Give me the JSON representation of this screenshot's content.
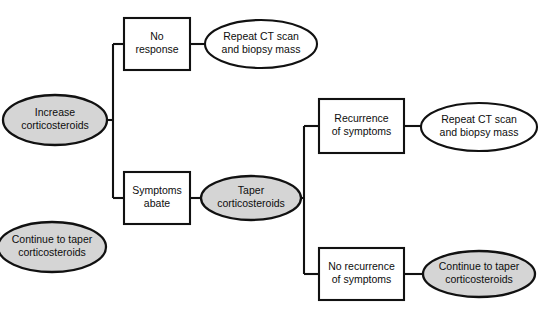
{
  "diagram": {
    "colors": {
      "filled_node_fill": "#d5d5d5",
      "plain_node_fill": "#ffffff",
      "stroke": "#111111",
      "background": "#ffffff",
      "text": "#0d0d0d"
    },
    "nodes": [
      {
        "id": "increase-corticosteroids",
        "shape": "ellipse",
        "fill": "filled",
        "lines": [
          "Increase",
          "corticosteroids"
        ],
        "cx": 55,
        "cy": 120,
        "rx": 52,
        "ry": 25
      },
      {
        "id": "no-response",
        "shape": "rect",
        "fill": "plain",
        "lines": [
          "No",
          "response"
        ],
        "x": 124,
        "y": 18,
        "w": 66,
        "h": 52
      },
      {
        "id": "repeat-ct-scan-biopsy-top",
        "shape": "ellipse",
        "fill": "plain",
        "lines": [
          "Repeat CT scan",
          "and biopsy mass"
        ],
        "cx": 261,
        "cy": 44,
        "rx": 56,
        "ry": 24
      },
      {
        "id": "symptoms-abate",
        "shape": "rect",
        "fill": "plain",
        "lines": [
          "Symptoms",
          "abate"
        ],
        "x": 124,
        "y": 172,
        "w": 66,
        "h": 52
      },
      {
        "id": "taper-corticosteroids",
        "shape": "ellipse",
        "fill": "filled",
        "lines": [
          "Taper",
          "corticosteroids"
        ],
        "cx": 251,
        "cy": 198,
        "rx": 50,
        "ry": 22
      },
      {
        "id": "recurrence-of-symptoms",
        "shape": "rect",
        "fill": "plain",
        "lines": [
          "Recurrence",
          "of symptoms"
        ],
        "x": 319,
        "y": 99,
        "w": 85,
        "h": 54
      },
      {
        "id": "repeat-ct-scan-biopsy-middle",
        "shape": "ellipse",
        "fill": "plain",
        "lines": [
          "Repeat CT scan",
          "and biopsy mass"
        ],
        "cx": 479,
        "cy": 127,
        "rx": 58,
        "ry": 24
      },
      {
        "id": "no-recurrence-of-symptoms",
        "shape": "rect",
        "fill": "plain",
        "lines": [
          "No recurrence",
          "of symptoms"
        ],
        "x": 319,
        "y": 248,
        "w": 85,
        "h": 52
      },
      {
        "id": "continue-to-taper-right",
        "shape": "ellipse",
        "fill": "filled",
        "lines": [
          "Continue to taper",
          "corticosteroids"
        ],
        "cx": 479,
        "cy": 274,
        "rx": 56,
        "ry": 23
      },
      {
        "id": "continue-to-taper-left",
        "shape": "ellipse",
        "fill": "filled",
        "lines": [
          "Continue to taper",
          "corticosteroids"
        ],
        "cx": 52,
        "cy": 247,
        "rx": 54,
        "ry": 25
      }
    ],
    "connectors": [
      {
        "id": "increase-to-trunk",
        "path": "M 107 120 L 113 120"
      },
      {
        "id": "left-trunk-vertical",
        "path": "M 113 44 L 113 198"
      },
      {
        "id": "trunk-to-no-response",
        "path": "M 113 44 L 124 44"
      },
      {
        "id": "trunk-to-symptoms-abate",
        "path": "M 113 198 L 124 198"
      },
      {
        "id": "no-response-to-repeat-ct-top",
        "path": "M 190 44 L 205 44"
      },
      {
        "id": "symptoms-abate-to-taper",
        "path": "M 190 198 L 201 198"
      },
      {
        "id": "taper-to-right-trunk",
        "path": "M 301 198 L 304 198"
      },
      {
        "id": "right-trunk-vertical",
        "path": "M 304 126 L 304 274"
      },
      {
        "id": "right-trunk-to-recurrence",
        "path": "M 304 126 L 319 126"
      },
      {
        "id": "right-trunk-to-no-recurrence",
        "path": "M 304 274 L 319 274"
      },
      {
        "id": "recurrence-to-repeat-ct-middle",
        "path": "M 404 126 L 421 126"
      },
      {
        "id": "no-recurrence-to-continue-taper",
        "path": "M 404 274 L 423 274"
      }
    ]
  }
}
